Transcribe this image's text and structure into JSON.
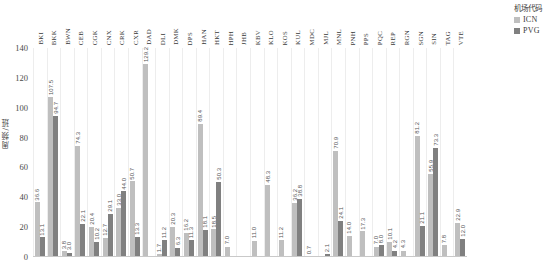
{
  "legend": {
    "title": "机场代码",
    "entries": [
      {
        "label": "ICN",
        "color": "#bfbfbf"
      },
      {
        "label": "PVG",
        "color": "#808080"
      }
    ]
  },
  "axis": {
    "ylabel": "周频/班",
    "yticks": [
      "0",
      "20",
      "40",
      "60",
      "80",
      "100",
      "120",
      "140"
    ]
  },
  "chart_data": {
    "type": "bar",
    "title": "",
    "xlabel": "",
    "ylabel": "周频/班",
    "ylim": [
      0,
      140
    ],
    "grid": true,
    "legend_position": "top-right",
    "legend_title": "机场代码",
    "categories": [
      "BKI",
      "BKK",
      "BWN",
      "CEB",
      "CGK",
      "CNX",
      "CRK",
      "CXR",
      "DAD",
      "DLI",
      "DMK",
      "DPS",
      "HAN",
      "HKT",
      "HPH",
      "JHB",
      "KBV",
      "KLO",
      "KOS",
      "KUL",
      "MDC",
      "MJL",
      "MNL",
      "PNH",
      "PPS",
      "PQC",
      "REP",
      "RGN",
      "SGN",
      "SIN",
      "TAG",
      "VTE"
    ],
    "series": [
      {
        "name": "ICN",
        "color": "#bfbfbf",
        "values": [
          36.6,
          107.5,
          3.8,
          74.3,
          20.4,
          12.7,
          33.0,
          50.7,
          129.2,
          1.7,
          20.3,
          16.2,
          89.4,
          18.5,
          7.0,
          0.0,
          11.0,
          48.3,
          11.2,
          36.2,
          0.7,
          0.0,
          70.9,
          14.0,
          17.3,
          7.0,
          10.1,
          4.3,
          81.2,
          55.9,
          7.8,
          22.9
        ],
        "labels": [
          "36.6",
          "107.5",
          "3.8",
          "74.3",
          "20.4",
          "12.7",
          "33.0",
          "50.7",
          "129.2",
          "1.7",
          "20.3",
          "16.2",
          "89.4",
          "18.5",
          "7.0",
          "",
          "11.0",
          "48.3",
          "11.2",
          "36.2",
          "0.7",
          "",
          "70.9",
          "14.0",
          "17.3",
          "7.0",
          "10.1",
          "4.3",
          "81.2",
          "55.9",
          "7.8",
          "22.9"
        ]
      },
      {
        "name": "PVG",
        "color": "#808080",
        "values": [
          13.1,
          94.7,
          3.0,
          22.1,
          10.2,
          29.1,
          44.0,
          13.3,
          0.0,
          11.2,
          6.3,
          11.3,
          18.1,
          50.3,
          0.0,
          0.0,
          0.0,
          0.0,
          0.0,
          38.8,
          0.0,
          2.1,
          24.1,
          0.0,
          0.0,
          8.0,
          4.2,
          0.0,
          21.1,
          73.3,
          0.0,
          12.0
        ],
        "labels": [
          "13.1",
          "94.7",
          "3.0",
          "22.1",
          "10.2",
          "29.1",
          "44.0",
          "13.3",
          "",
          "11.2",
          "6.3",
          "11.3",
          "18.1",
          "50.3",
          "",
          "",
          "",
          "",
          "",
          "38.8",
          "",
          "2.1",
          "24.1",
          "",
          "",
          "8.0",
          "4.2",
          "",
          "21.1",
          "73.3",
          "",
          "12.0"
        ]
      }
    ]
  }
}
